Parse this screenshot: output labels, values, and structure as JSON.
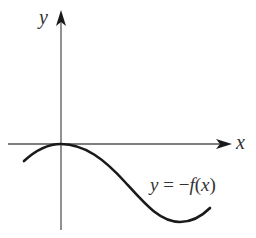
{
  "figure": {
    "y_axis_label": "y",
    "x_axis_label": "x",
    "curve_label": {
      "y": "y",
      "equals": " = ",
      "minus": "−",
      "f": "f",
      "open_paren": "(",
      "x": "x",
      "close_paren": ")"
    },
    "curve_label_full": "y = −f(x)",
    "colors": {
      "axis": "#555555",
      "curve": "#1a1a1a",
      "text": "#333333"
    }
  }
}
